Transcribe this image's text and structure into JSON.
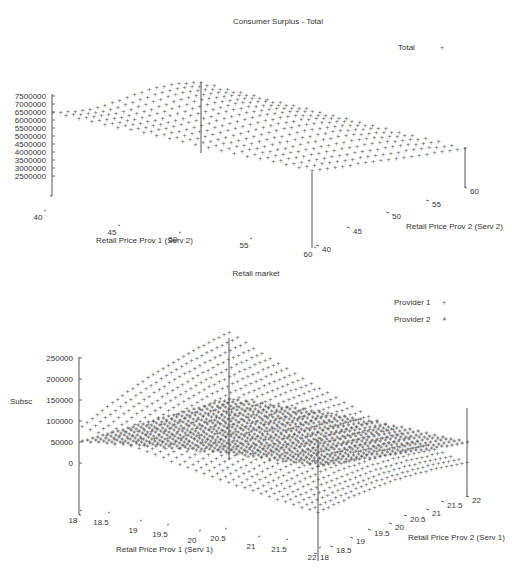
{
  "chart_data": [
    {
      "type": "surface3d",
      "title": "Consumer Surplus - Total",
      "xlabel": "Retail Price Prov 1 (Serv 2)",
      "ylabel": "Retail Price Prov 2 (Serv 2)",
      "zlabel": "",
      "x_ticks": [
        "40",
        "45",
        "50",
        "55",
        "60"
      ],
      "y_ticks": [
        "40",
        "45",
        "50",
        "55",
        "60"
      ],
      "z_ticks": [
        "7500000",
        "7000000",
        "6500000",
        "6000000",
        "5500000",
        "5000000",
        "4500000",
        "4000000",
        "3500000",
        "3000000",
        "2500000"
      ],
      "xlim": [
        40,
        60
      ],
      "ylim": [
        40,
        60
      ],
      "zlim": [
        2500000,
        7500000
      ],
      "legend": [
        {
          "name": "Total",
          "marker": "+"
        }
      ],
      "legend_position": "top-right",
      "series": [
        {
          "name": "Total",
          "marker": "+",
          "surface_range_approx": [
            4500000,
            7000000
          ],
          "description": "Surface declining from ~6.5M-7M at low Prov1 prices to ~4.5M-5M at high Prov1 prices"
        }
      ]
    },
    {
      "type": "surface3d",
      "title": "Retail market",
      "xlabel": "Retail Price Prov 1 (Serv 1)",
      "ylabel": "Retail Price Prov 2 (Serv 1)",
      "zlabel": "Subsc",
      "x_ticks": [
        "18",
        "18.5",
        "19",
        "19.5",
        "20",
        "20.5",
        "21",
        "21.5",
        "22"
      ],
      "y_ticks": [
        "18",
        "18.5",
        "19",
        "19.5",
        "20",
        "20.5",
        "21",
        "21.5",
        "22"
      ],
      "z_ticks": [
        "250000",
        "200000",
        "150000",
        "100000",
        "50000",
        "0"
      ],
      "xlim": [
        18,
        22
      ],
      "ylim": [
        18,
        22
      ],
      "zlim": [
        0,
        250000
      ],
      "legend": [
        {
          "name": "Provider 1",
          "marker": "+"
        },
        {
          "name": "Provider 2",
          "marker": "*"
        }
      ],
      "legend_position": "top-right",
      "series": [
        {
          "name": "Provider 1",
          "marker": "+",
          "surface_range_approx": [
            0,
            230000
          ]
        },
        {
          "name": "Provider 2",
          "marker": "*",
          "surface_range_approx": [
            40000,
            130000
          ]
        }
      ]
    }
  ],
  "chart1": {
    "title": "Consumer Surplus - Total",
    "legend_label": "Total",
    "legend_marker": "+",
    "z_ticks": [
      "7500000",
      "7000000",
      "6500000",
      "6000000",
      "5500000",
      "5000000",
      "4500000",
      "4000000",
      "3500000",
      "3000000",
      "2500000"
    ],
    "x_ticks": [
      "40",
      "45",
      "50",
      "55",
      "60"
    ],
    "y_ticks": [
      "40",
      "45",
      "50",
      "55",
      "60"
    ],
    "xlabel": "Retail Price Prov 1 (Serv 2)",
    "ylabel": "Retail Price Prov 2 (Serv 2)"
  },
  "chart2": {
    "title": "Retail market",
    "legend": [
      {
        "label": "Provider 1",
        "marker": "+"
      },
      {
        "label": "Provider 2",
        "marker": "*"
      }
    ],
    "zlabel": "Subsc",
    "z_ticks": [
      "250000",
      "200000",
      "150000",
      "100000",
      "50000",
      "0"
    ],
    "x_ticks": [
      "18",
      "18.5",
      "19",
      "19.5",
      "20",
      "20.5",
      "21",
      "21.5",
      "22"
    ],
    "y_ticks": [
      "18",
      "18.5",
      "19",
      "19.5",
      "20",
      "20.5",
      "21",
      "21.5",
      "22"
    ],
    "xlabel": "Retail Price Prov 1 (Serv 1)",
    "ylabel": "Retail Price Prov 2 (Serv 1)"
  }
}
